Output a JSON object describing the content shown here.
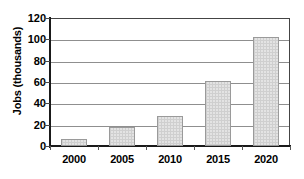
{
  "chart_data": {
    "type": "bar",
    "title": "",
    "xlabel": "",
    "ylabel": "Jobs (thousands)",
    "categories": [
      "2000",
      "2005",
      "2010",
      "2015",
      "2020"
    ],
    "values": [
      7,
      18,
      28,
      61,
      102
    ],
    "ylim": [
      0,
      120
    ],
    "yticks": [
      0,
      20,
      40,
      60,
      80,
      100,
      120
    ],
    "ytick_labels": [
      "0",
      "20",
      "40",
      "60",
      "80",
      "100",
      "120"
    ],
    "grid": "horizontal",
    "legend": "none",
    "series": [
      {
        "name": "Jobs",
        "values": [
          7,
          18,
          28,
          61,
          102
        ]
      }
    ],
    "bar_fill_color": "#e3e3e3",
    "bar_border_color": "#9a9a9a",
    "gridline_color": "#8f8f8f",
    "axis_color": "#1a1a1a",
    "background_color": "#ffffff"
  }
}
